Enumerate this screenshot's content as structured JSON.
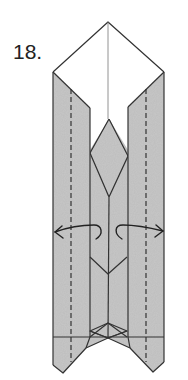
{
  "diagram": {
    "step_label": "18.",
    "colors": {
      "paper_colored": "#c8c8c8",
      "paper_white": "#ffffff",
      "line": "#333333",
      "valley_fold": "#333333"
    },
    "elements": [
      {
        "type": "white-top-flap",
        "shape": "diamond top"
      },
      {
        "type": "left-colored-panel"
      },
      {
        "type": "right-colored-panel"
      },
      {
        "type": "center-diamond"
      },
      {
        "type": "valley-fold-lines",
        "count": 2,
        "style": "dashed"
      },
      {
        "type": "open-arrows",
        "count": 2,
        "direction": "outward"
      },
      {
        "type": "bottom-notch-with-small-diamond"
      }
    ]
  }
}
